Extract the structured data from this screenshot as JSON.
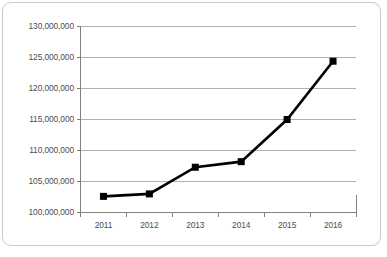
{
  "chart_data": {
    "type": "line",
    "title": "",
    "subtitle": "",
    "xlabel": "",
    "ylabel": "",
    "categories": [
      "2011",
      "2012",
      "2013",
      "2014",
      "2015",
      "2016"
    ],
    "values": [
      102600000,
      103000000,
      107300000,
      108200000,
      115000000,
      124400000
    ],
    "series": [
      {
        "name": "",
        "values": [
          102600000,
          103000000,
          107300000,
          108200000,
          115000000,
          124400000
        ]
      }
    ],
    "ylim": [
      100000000,
      130000000
    ],
    "yticks": [
      100000000,
      105000000,
      110000000,
      115000000,
      120000000,
      125000000,
      130000000
    ],
    "ytick_labels": [
      "100,000,000",
      "105,000,000",
      "110,000,000",
      "115,000,000",
      "120,000,000",
      "125,000,000",
      "130,000,000"
    ],
    "xtick_labels": [
      "2011",
      "2012",
      "2013",
      "2014",
      "2015",
      "2016"
    ],
    "grid": true,
    "grid_axis": "y",
    "legend": false,
    "legend_position": "none",
    "annotations": [],
    "colors": {
      "line": "#000000",
      "marker": "#000000",
      "grid": "#b0b0b0",
      "axis": "#808080",
      "tick_text": "#4d4d4d",
      "frame_border": "#c9c9c9",
      "background": "#ffffff"
    },
    "marker_style": "square",
    "line_width": 2.6,
    "marker_size": 7
  }
}
